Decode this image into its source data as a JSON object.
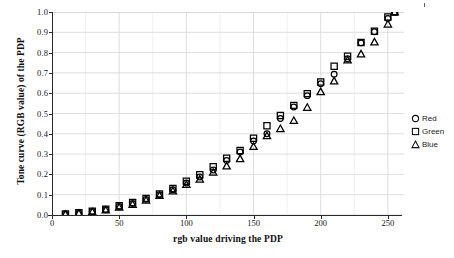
{
  "figure": {
    "background": "#ffffff",
    "ink_color": "#101010",
    "grid_color": "#d9d9d9",
    "axis_color": "#2b2b2b"
  },
  "axes": {
    "y_ticks": [
      "1.0",
      "0.9",
      "0.8",
      "0.7",
      "0.6",
      "0.5",
      "0.4",
      "0.3",
      "0.2",
      "0.1",
      "0.0"
    ],
    "x_ticks": [
      "0",
      "50",
      "100",
      "150",
      "200",
      "250"
    ],
    "x_title": "rgb value driving the PDP",
    "y_title": "Tone curve (RGB value) of the PDP"
  },
  "legend": {
    "position": "right",
    "items": [
      {
        "label": "Red",
        "marker": "circle"
      },
      {
        "label": "Green",
        "marker": "square"
      },
      {
        "label": "Blue",
        "marker": "triangle"
      }
    ]
  },
  "chart_data": {
    "type": "scatter",
    "title": "",
    "subtitle": "",
    "xlabel": "rgb value driving the PDP",
    "ylabel": "Tone curve (RGB value) of the PDP",
    "xlim": [
      0,
      262
    ],
    "ylim": [
      0.0,
      1.0
    ],
    "xticks": [
      0,
      50,
      100,
      150,
      200,
      250
    ],
    "yticks": [
      0.0,
      0.1,
      0.2,
      0.3,
      0.4,
      0.5,
      0.6,
      0.7,
      0.8,
      0.9,
      1.0
    ],
    "grid": true,
    "grid_minor_x_step": 25,
    "legend_position": "right",
    "x": [
      10,
      20,
      30,
      40,
      50,
      60,
      70,
      80,
      90,
      100,
      110,
      120,
      130,
      140,
      150,
      160,
      170,
      180,
      190,
      200,
      210,
      220,
      230,
      240,
      250,
      255
    ],
    "series": [
      {
        "name": "Red",
        "marker": "circle",
        "color": "#000000",
        "values": [
          0.004,
          0.009,
          0.017,
          0.026,
          0.042,
          0.057,
          0.077,
          0.1,
          0.125,
          0.158,
          0.187,
          0.222,
          0.268,
          0.31,
          0.365,
          0.4,
          0.475,
          0.532,
          0.588,
          0.647,
          0.693,
          0.77,
          0.848,
          0.903,
          0.968,
          1.0
        ]
      },
      {
        "name": "Green",
        "marker": "square",
        "color": "#000000",
        "values": [
          0.005,
          0.011,
          0.019,
          0.029,
          0.046,
          0.062,
          0.082,
          0.104,
          0.131,
          0.166,
          0.198,
          0.238,
          0.28,
          0.318,
          0.378,
          0.44,
          0.49,
          0.54,
          0.598,
          0.655,
          0.733,
          0.782,
          0.85,
          0.905,
          0.975,
          1.0
        ]
      },
      {
        "name": "Blue",
        "marker": "triangle",
        "color": "#000000",
        "values": [
          0.003,
          0.008,
          0.015,
          0.024,
          0.038,
          0.052,
          0.072,
          0.096,
          0.118,
          0.15,
          0.176,
          0.21,
          0.241,
          0.277,
          0.337,
          0.39,
          0.425,
          0.465,
          0.53,
          0.607,
          0.66,
          0.763,
          0.793,
          0.852,
          0.94,
          1.0
        ]
      }
    ]
  }
}
